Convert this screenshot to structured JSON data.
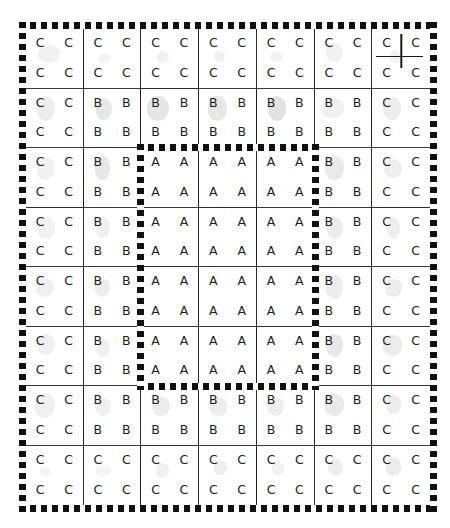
{
  "figure": {
    "type": "hand-drawn grid diagram",
    "rows": 8,
    "columns": 7,
    "letters_per_cell": 4,
    "letter_arrangement": "2x2",
    "zone_labels": [
      "A",
      "B",
      "C"
    ],
    "colors": {
      "ink": "#1c1c1c",
      "grid_line": "#2b2b2b",
      "border_dots": "#111111",
      "smudge": "#b9bdb8",
      "paper": "#ffffff"
    }
  },
  "chart_data": {
    "type": "heatmap",
    "title": "",
    "xlabel": "",
    "ylabel": "",
    "categories": [
      "col1",
      "col2",
      "col3",
      "col4",
      "col5",
      "col6",
      "col7"
    ],
    "row_labels": [
      "row1",
      "row2",
      "row3",
      "row4",
      "row5",
      "row6",
      "row7",
      "row8"
    ],
    "legend": [
      "A",
      "B",
      "C"
    ],
    "grid": [
      [
        "C",
        "C",
        "C",
        "C",
        "C",
        "C",
        "C"
      ],
      [
        "C",
        "B",
        "B",
        "B",
        "B",
        "B",
        "C"
      ],
      [
        "C",
        "B",
        "A",
        "A",
        "A",
        "B",
        "C"
      ],
      [
        "C",
        "B",
        "A",
        "A",
        "A",
        "B",
        "C"
      ],
      [
        "C",
        "B",
        "A",
        "A",
        "A",
        "B",
        "C"
      ],
      [
        "C",
        "B",
        "A",
        "A",
        "A",
        "B",
        "C"
      ],
      [
        "C",
        "B",
        "B",
        "B",
        "B",
        "B",
        "C"
      ],
      [
        "C",
        "C",
        "C",
        "C",
        "C",
        "C",
        "C"
      ]
    ]
  },
  "cells": [
    [
      {
        "letter": "C",
        "smudges": [
          {
            "x": 22,
            "y": 28,
            "w": 38,
            "h": 30,
            "o": 0.2
          }
        ]
      },
      {
        "letter": "C",
        "smudges": [
          {
            "x": 26,
            "y": 42,
            "w": 22,
            "h": 16,
            "o": 0.16
          }
        ]
      },
      {
        "letter": "C",
        "smudges": [
          {
            "x": 28,
            "y": 38,
            "w": 20,
            "h": 20,
            "o": 0.22
          }
        ]
      },
      {
        "letter": "C",
        "smudges": [
          {
            "x": 26,
            "y": 38,
            "w": 20,
            "h": 18,
            "o": 0.2
          }
        ]
      },
      {
        "letter": "C",
        "smudges": [
          {
            "x": 24,
            "y": 40,
            "w": 22,
            "h": 16,
            "o": 0.18
          }
        ]
      },
      {
        "letter": "C",
        "smudges": [
          {
            "x": 20,
            "y": 24,
            "w": 30,
            "h": 32,
            "o": 0.2
          }
        ]
      },
      {
        "letter": "C",
        "smudges": [
          {
            "x": 30,
            "y": 36,
            "w": 18,
            "h": 22,
            "o": 0.18
          }
        ],
        "crosshair": true
      }
    ],
    [
      {
        "letter": "C",
        "smudges": [
          {
            "x": 20,
            "y": 12,
            "w": 32,
            "h": 44,
            "o": 0.26
          }
        ]
      },
      {
        "letter": "B",
        "smudges": [
          {
            "x": 22,
            "y": 16,
            "w": 28,
            "h": 38,
            "o": 0.34
          }
        ]
      },
      {
        "letter": "B",
        "smudges": [
          {
            "x": 10,
            "y": 12,
            "w": 38,
            "h": 44,
            "o": 0.36
          }
        ]
      },
      {
        "letter": "B",
        "smudges": [
          {
            "x": 16,
            "y": 12,
            "w": 34,
            "h": 44,
            "o": 0.34
          }
        ]
      },
      {
        "letter": "B",
        "smudges": [
          {
            "x": 20,
            "y": 12,
            "w": 32,
            "h": 44,
            "o": 0.42
          }
        ]
      },
      {
        "letter": "B",
        "smudges": [
          {
            "x": 12,
            "y": 16,
            "w": 40,
            "h": 34,
            "o": 0.22
          }
        ]
      },
      {
        "letter": "C",
        "smudges": [
          {
            "x": 18,
            "y": 14,
            "w": 32,
            "h": 40,
            "o": 0.26
          }
        ]
      }
    ],
    [
      {
        "letter": "C",
        "smudges": [
          {
            "x": 20,
            "y": 16,
            "w": 30,
            "h": 38,
            "o": 0.2
          }
        ]
      },
      {
        "letter": "B",
        "smudges": [
          {
            "x": 20,
            "y": 14,
            "w": 26,
            "h": 40,
            "o": 0.34
          }
        ]
      },
      {
        "letter": "A",
        "smudges": []
      },
      {
        "letter": "A",
        "smudges": []
      },
      {
        "letter": "A",
        "smudges": []
      },
      {
        "letter": "B",
        "smudges": [
          {
            "x": 18,
            "y": 14,
            "w": 34,
            "h": 40,
            "o": 0.3
          }
        ]
      },
      {
        "letter": "C",
        "smudges": [
          {
            "x": 20,
            "y": 18,
            "w": 32,
            "h": 34,
            "o": 0.24
          }
        ]
      }
    ],
    [
      {
        "letter": "C",
        "smudges": [
          {
            "x": 20,
            "y": 16,
            "w": 32,
            "h": 38,
            "o": 0.18
          }
        ]
      },
      {
        "letter": "B",
        "smudges": [
          {
            "x": 20,
            "y": 16,
            "w": 26,
            "h": 36,
            "o": 0.22
          }
        ]
      },
      {
        "letter": "A",
        "smudges": []
      },
      {
        "letter": "A",
        "smudges": []
      },
      {
        "letter": "A",
        "smudges": []
      },
      {
        "letter": "B",
        "smudges": [
          {
            "x": 20,
            "y": 16,
            "w": 30,
            "h": 38,
            "o": 0.28
          }
        ]
      },
      {
        "letter": "C",
        "smudges": [
          {
            "x": 26,
            "y": 16,
            "w": 22,
            "h": 38,
            "o": 0.24
          }
        ]
      }
    ],
    [
      {
        "letter": "C",
        "smudges": [
          {
            "x": 18,
            "y": 18,
            "w": 32,
            "h": 34,
            "o": 0.22
          }
        ]
      },
      {
        "letter": "B",
        "smudges": [
          {
            "x": 20,
            "y": 18,
            "w": 26,
            "h": 34,
            "o": 0.26
          }
        ]
      },
      {
        "letter": "A",
        "smudges": []
      },
      {
        "letter": "A",
        "smudges": []
      },
      {
        "letter": "A",
        "smudges": []
      },
      {
        "letter": "B",
        "smudges": [
          {
            "x": 20,
            "y": 14,
            "w": 30,
            "h": 40,
            "o": 0.26
          }
        ]
      },
      {
        "letter": "C",
        "smudges": [
          {
            "x": 22,
            "y": 20,
            "w": 30,
            "h": 32,
            "o": 0.26
          }
        ]
      }
    ],
    [
      {
        "letter": "C",
        "smudges": [
          {
            "x": 20,
            "y": 12,
            "w": 32,
            "h": 36,
            "o": 0.22
          }
        ]
      },
      {
        "letter": "B",
        "smudges": [
          {
            "x": 22,
            "y": 22,
            "w": 24,
            "h": 30,
            "o": 0.22
          }
        ]
      },
      {
        "letter": "A",
        "smudges": []
      },
      {
        "letter": "A",
        "smudges": []
      },
      {
        "letter": "A",
        "smudges": []
      },
      {
        "letter": "B",
        "smudges": [
          {
            "x": 20,
            "y": 12,
            "w": 30,
            "h": 40,
            "o": 0.32
          }
        ]
      },
      {
        "letter": "C",
        "smudges": [
          {
            "x": 18,
            "y": 14,
            "w": 34,
            "h": 36,
            "o": 0.28
          }
        ]
      }
    ],
    [
      {
        "letter": "C",
        "smudges": [
          {
            "x": 16,
            "y": 12,
            "w": 36,
            "h": 42,
            "o": 0.22
          }
        ]
      },
      {
        "letter": "B",
        "smudges": [
          {
            "x": 20,
            "y": 20,
            "w": 28,
            "h": 32,
            "o": 0.2
          }
        ]
      },
      {
        "letter": "B",
        "smudges": [
          {
            "x": 18,
            "y": 18,
            "w": 32,
            "h": 34,
            "o": 0.26
          }
        ]
      },
      {
        "letter": "B",
        "smudges": [
          {
            "x": 18,
            "y": 18,
            "w": 32,
            "h": 34,
            "o": 0.26
          }
        ]
      },
      {
        "letter": "B",
        "smudges": [
          {
            "x": 18,
            "y": 18,
            "w": 30,
            "h": 34,
            "o": 0.24
          }
        ]
      },
      {
        "letter": "B",
        "smudges": [
          {
            "x": 16,
            "y": 14,
            "w": 36,
            "h": 38,
            "o": 0.3
          }
        ]
      },
      {
        "letter": "C",
        "smudges": [
          {
            "x": 24,
            "y": 14,
            "w": 26,
            "h": 34,
            "o": 0.26
          }
        ]
      }
    ],
    [
      {
        "letter": "C",
        "smudges": [
          {
            "x": 24,
            "y": 34,
            "w": 20,
            "h": 18,
            "o": 0.14
          }
        ]
      },
      {
        "letter": "C",
        "smudges": [
          {
            "x": 22,
            "y": 32,
            "w": 26,
            "h": 20,
            "o": 0.16
          }
        ]
      },
      {
        "letter": "C",
        "smudges": [
          {
            "x": 26,
            "y": 30,
            "w": 22,
            "h": 24,
            "o": 0.22
          }
        ]
      },
      {
        "letter": "C",
        "smudges": [
          {
            "x": 26,
            "y": 24,
            "w": 24,
            "h": 26,
            "o": 0.24
          }
        ]
      },
      {
        "letter": "C",
        "smudges": [
          {
            "x": 26,
            "y": 28,
            "w": 22,
            "h": 22,
            "o": 0.2
          }
        ]
      },
      {
        "letter": "C",
        "smudges": [
          {
            "x": 24,
            "y": 22,
            "w": 26,
            "h": 30,
            "o": 0.24
          }
        ]
      },
      {
        "letter": "C",
        "smudges": [
          {
            "x": 24,
            "y": 20,
            "w": 26,
            "h": 32,
            "o": 0.28
          }
        ]
      }
    ]
  ],
  "region_outline": {
    "name": "inner-A-region",
    "start_col": 3,
    "end_col": 5,
    "start_row": 3,
    "end_row": 6
  }
}
